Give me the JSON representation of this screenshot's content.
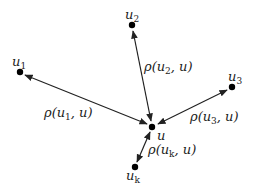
{
  "diagram": {
    "type": "star-graph",
    "center": {
      "id": "u",
      "label": "u"
    },
    "nodes": [
      {
        "id": "u1",
        "base": "u",
        "sub": "1"
      },
      {
        "id": "u2",
        "base": "u",
        "sub": "2"
      },
      {
        "id": "u3",
        "base": "u",
        "sub": "3"
      },
      {
        "id": "uk",
        "base": "u",
        "sub": "k"
      }
    ],
    "edges": [
      {
        "from": "u1",
        "to": "u",
        "directed": "both",
        "label_pre": "ρ(u",
        "label_sub": "1",
        "label_post": ", u)"
      },
      {
        "from": "u2",
        "to": "u",
        "directed": "both",
        "label_pre": "ρ(u",
        "label_sub": "2",
        "label_post": ", u)"
      },
      {
        "from": "u3",
        "to": "u",
        "directed": "both",
        "label_pre": "ρ(u",
        "label_sub": "3",
        "label_post": ", u)"
      },
      {
        "from": "uk",
        "to": "u",
        "directed": "both",
        "label_pre": "ρ(u",
        "label_sub": "k",
        "label_post": ", u)"
      }
    ],
    "colors": {
      "ink": "#222222",
      "background": "#ffffff"
    }
  }
}
